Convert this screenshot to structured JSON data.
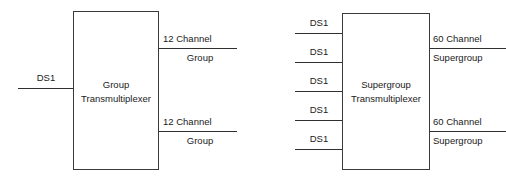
{
  "diagram": {
    "stroke_color": "#2f2f2f",
    "text_color": "#1a1a1a",
    "background_color": "#ffffff",
    "blocks": [
      {
        "id": "group-transmultiplexer",
        "line1": "Group",
        "line2": "Transmultiplexer"
      },
      {
        "id": "supergroup-transmultiplexer",
        "line1": "Supergroup",
        "line2": "Transmultiplexer"
      }
    ],
    "left_unit": {
      "inputs": [
        {
          "label": "DS1"
        }
      ],
      "outputs": [
        {
          "label_above": "12 Channel",
          "label_below": "Group"
        },
        {
          "label_above": "12 Channel",
          "label_below": "Group"
        }
      ]
    },
    "right_unit": {
      "inputs": [
        {
          "label": "DS1"
        },
        {
          "label": "DS1"
        },
        {
          "label": "DS1"
        },
        {
          "label": "DS1"
        },
        {
          "label": "DS1"
        }
      ],
      "outputs": [
        {
          "label_above": "60 Channel",
          "label_below": "Supergroup"
        },
        {
          "label_above": "60 Channel",
          "label_below": "Supergroup"
        }
      ]
    }
  }
}
